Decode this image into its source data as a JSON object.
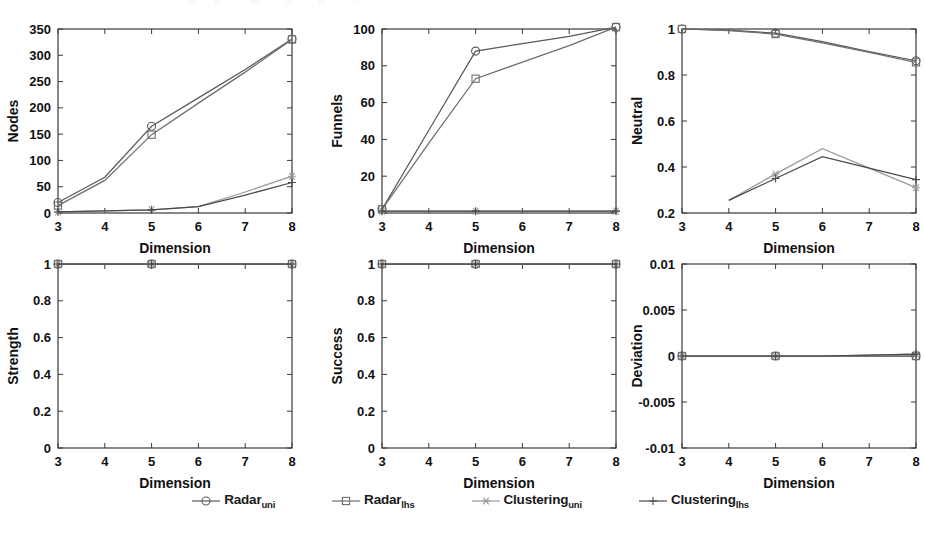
{
  "figure": {
    "x_tick_labels": [
      "3",
      "4",
      "5",
      "6",
      "7",
      "8"
    ],
    "x_axis_label": "Dimension",
    "series_colors": {
      "radar_uni": "#5a5a5a",
      "radar_lhs": "#6e6e6e",
      "clustering_uni": "#9a9a9a",
      "clustering_lhs": "#4a4a4a"
    },
    "legend": [
      {
        "label": "Radar",
        "sub": "uni",
        "marker": "circle-marker",
        "color": "#5a5a5a"
      },
      {
        "label": "Radar",
        "sub": "lhs",
        "marker": "square-marker",
        "color": "#6e6e6e"
      },
      {
        "label": "Clustering",
        "sub": "uni",
        "marker": "asterisk-marker",
        "color": "#9a9a9a"
      },
      {
        "label": "Clustering",
        "sub": "lhs",
        "marker": "plus-marker",
        "color": "#4a4a4a"
      }
    ]
  },
  "chart_data": [
    {
      "type": "line",
      "name": "nodes",
      "title": "",
      "xlabel": "Dimension",
      "ylabel": "Nodes",
      "x": [
        3,
        4,
        5,
        6,
        7,
        8
      ],
      "xlim": [
        3,
        8
      ],
      "ylim": [
        0,
        350
      ],
      "yticks": [
        0,
        50,
        100,
        150,
        200,
        250,
        300,
        350
      ],
      "ytick_labels": [
        "0",
        "50",
        "100",
        "150",
        "200",
        "250",
        "300",
        "350"
      ],
      "grid": false,
      "legend_position": "bottom-figure",
      "series": [
        {
          "name": "Radar_uni",
          "marker": "circle",
          "values": [
            20,
            68,
            165,
            219,
            273,
            331
          ]
        },
        {
          "name": "Radar_lhs",
          "marker": "square",
          "values": [
            14,
            62,
            149,
            209,
            268,
            330
          ]
        },
        {
          "name": "Clustering_uni",
          "marker": "asterisk",
          "values": [
            2,
            4,
            6,
            12,
            40,
            70
          ]
        },
        {
          "name": "Clustering_lhs",
          "marker": "plus",
          "values": [
            2,
            4,
            6,
            12,
            34,
            58
          ]
        }
      ]
    },
    {
      "type": "line",
      "name": "funnels",
      "title": "",
      "xlabel": "Dimension",
      "ylabel": "Funnels",
      "x": [
        3,
        4,
        5,
        6,
        7,
        8
      ],
      "xlim": [
        3,
        8
      ],
      "ylim": [
        0,
        100
      ],
      "yticks": [
        0,
        20,
        40,
        60,
        80,
        100
      ],
      "ytick_labels": [
        "0",
        "20",
        "40",
        "60",
        "80",
        "100"
      ],
      "grid": false,
      "legend_position": "bottom-figure",
      "series": [
        {
          "name": "Radar_uni",
          "marker": "circle",
          "values": [
            2,
            45,
            88,
            92,
            96,
            101
          ]
        },
        {
          "name": "Radar_lhs",
          "marker": "square",
          "values": [
            2,
            38,
            73,
            82,
            91,
            101
          ]
        },
        {
          "name": "Clustering_uni",
          "marker": "asterisk",
          "values": [
            1,
            1,
            1,
            1,
            1,
            1
          ]
        },
        {
          "name": "Clustering_lhs",
          "marker": "plus",
          "values": [
            1,
            1,
            1,
            1,
            1,
            1
          ]
        }
      ]
    },
    {
      "type": "line",
      "name": "neutral",
      "title": "",
      "xlabel": "Dimension",
      "ylabel": "Neutral",
      "x": [
        3,
        4,
        5,
        6,
        7,
        8
      ],
      "xlim": [
        3,
        8
      ],
      "ylim": [
        0.2,
        1
      ],
      "yticks": [
        0.2,
        0.4,
        0.6,
        0.8,
        1
      ],
      "ytick_labels": [
        "0.2",
        "0.4",
        "0.6",
        "0.8",
        "1"
      ],
      "grid": false,
      "legend_position": "bottom-figure",
      "series": [
        {
          "name": "Radar_uni",
          "marker": "circle",
          "values": [
            1.0,
            0.995,
            0.982,
            0.945,
            0.902,
            0.862
          ]
        },
        {
          "name": "Radar_lhs",
          "marker": "square",
          "values": [
            1.0,
            0.993,
            0.978,
            0.94,
            0.898,
            0.855
          ]
        },
        {
          "name": "Clustering_uni",
          "marker": "asterisk",
          "values": [
            null,
            0.255,
            0.37,
            0.48,
            0.395,
            0.31
          ]
        },
        {
          "name": "Clustering_lhs",
          "marker": "plus",
          "values": [
            null,
            0.255,
            0.35,
            0.445,
            0.395,
            0.345
          ]
        }
      ]
    },
    {
      "type": "line",
      "name": "strength",
      "title": "",
      "xlabel": "Dimension",
      "ylabel": "Strength",
      "x": [
        3,
        4,
        5,
        6,
        7,
        8
      ],
      "xlim": [
        3,
        8
      ],
      "ylim": [
        0,
        1
      ],
      "yticks": [
        0,
        0.2,
        0.4,
        0.6,
        0.8,
        1
      ],
      "ytick_labels": [
        "0",
        "0.2",
        "0.4",
        "0.6",
        "0.8",
        "1"
      ],
      "grid": false,
      "legend_position": "bottom-figure",
      "series": [
        {
          "name": "Radar_uni",
          "marker": "circle",
          "values": [
            1,
            1,
            1,
            1,
            1,
            1
          ]
        },
        {
          "name": "Radar_lhs",
          "marker": "square",
          "values": [
            1,
            1,
            1,
            1,
            1,
            1
          ]
        },
        {
          "name": "Clustering_uni",
          "marker": "asterisk",
          "values": [
            1,
            1,
            1,
            1,
            1,
            1
          ]
        },
        {
          "name": "Clustering_lhs",
          "marker": "plus",
          "values": [
            1,
            1,
            1,
            1,
            1,
            1
          ]
        }
      ]
    },
    {
      "type": "line",
      "name": "success",
      "title": "",
      "xlabel": "Dimension",
      "ylabel": "Success",
      "x": [
        3,
        4,
        5,
        6,
        7,
        8
      ],
      "xlim": [
        3,
        8
      ],
      "ylim": [
        0,
        1
      ],
      "yticks": [
        0,
        0.2,
        0.4,
        0.6,
        0.8,
        1
      ],
      "ytick_labels": [
        "0",
        "0.2",
        "0.4",
        "0.6",
        "0.8",
        "1"
      ],
      "grid": false,
      "legend_position": "bottom-figure",
      "series": [
        {
          "name": "Radar_uni",
          "marker": "circle",
          "values": [
            1,
            1,
            1,
            1,
            1,
            1
          ]
        },
        {
          "name": "Radar_lhs",
          "marker": "square",
          "values": [
            1,
            1,
            1,
            1,
            1,
            1
          ]
        },
        {
          "name": "Clustering_uni",
          "marker": "asterisk",
          "values": [
            1,
            1,
            1,
            1,
            1,
            1
          ]
        },
        {
          "name": "Clustering_lhs",
          "marker": "plus",
          "values": [
            1,
            1,
            1,
            1,
            1,
            1
          ]
        }
      ]
    },
    {
      "type": "line",
      "name": "deviation",
      "title": "",
      "xlabel": "Dimension",
      "ylabel": "Deviation",
      "x": [
        3,
        4,
        5,
        6,
        7,
        8
      ],
      "xlim": [
        3,
        8
      ],
      "ylim": [
        -0.01,
        0.01
      ],
      "yticks": [
        -0.01,
        -0.005,
        0,
        0.005,
        0.01
      ],
      "ytick_labels": [
        "-0.01",
        "-0.005",
        "0",
        "0.005",
        "0.01"
      ],
      "grid": false,
      "legend_position": "bottom-figure",
      "series": [
        {
          "name": "Radar_uni",
          "marker": "circle",
          "values": [
            0,
            0,
            0,
            0,
            0,
            0
          ]
        },
        {
          "name": "Radar_lhs",
          "marker": "square",
          "values": [
            0,
            0,
            0,
            0,
            0,
            0
          ]
        },
        {
          "name": "Clustering_uni",
          "marker": "asterisk",
          "values": [
            0,
            0,
            0,
            0,
            0.0001,
            0.0002
          ]
        },
        {
          "name": "Clustering_lhs",
          "marker": "plus",
          "values": [
            0,
            0,
            0,
            0,
            0.0001,
            0.0002
          ]
        }
      ]
    }
  ]
}
